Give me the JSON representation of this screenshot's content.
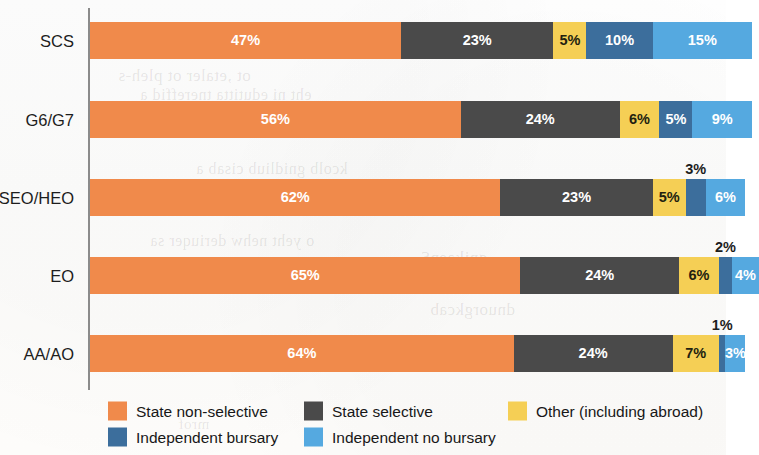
{
  "chart_data": {
    "type": "bar",
    "subtype": "horizontal-100-percent-stacked",
    "title": "",
    "xlabel": "",
    "ylabel": "",
    "xlim": [
      0,
      100
    ],
    "grid": false,
    "legend_position": "bottom-left",
    "categories": [
      "SCS",
      "G6/G7",
      "SEO/HEO",
      "EO",
      "AA/AO"
    ],
    "series": [
      {
        "name": "State non-selective",
        "color": "#F08A4B",
        "values": [
          47,
          56,
          62,
          65,
          64
        ],
        "labels": [
          "47%",
          "56%",
          "62%",
          "65%",
          "64%"
        ]
      },
      {
        "name": "State selective",
        "color": "#4A4A4A",
        "values": [
          23,
          24,
          23,
          24,
          24
        ],
        "labels": [
          "23%",
          "24%",
          "23%",
          "24%",
          "24%"
        ]
      },
      {
        "name": "Other (including abroad)",
        "color": "#F5CF55",
        "values": [
          5,
          6,
          5,
          6,
          7
        ],
        "labels": [
          "5%",
          "6%",
          "5%",
          "6%",
          "7%"
        ]
      },
      {
        "name": "Independent bursary",
        "color": "#3C6E9C",
        "values": [
          10,
          5,
          3,
          2,
          1
        ],
        "labels": [
          "10%",
          "5%",
          "3%",
          "2%",
          "1%"
        ]
      },
      {
        "name": "Independent no bursary",
        "color": "#55A9E0",
        "values": [
          15,
          9,
          6,
          4,
          3
        ],
        "labels": [
          "15%",
          "9%",
          "6%",
          "4%",
          "3%"
        ]
      }
    ]
  },
  "axis": {
    "categories": [
      "SCS",
      "G6/G7",
      "SEO/HEO",
      "EO",
      "AA/AO"
    ]
  },
  "bars": [
    {
      "category": "SCS",
      "segments": [
        {
          "series": "State non-selective",
          "value": 47,
          "label": "47%",
          "color": "#F08A4B",
          "text": "light",
          "placement": "inside"
        },
        {
          "series": "State selective",
          "value": 23,
          "label": "23%",
          "color": "#4A4A4A",
          "text": "light",
          "placement": "inside"
        },
        {
          "series": "Other (including abroad)",
          "value": 5,
          "label": "5%",
          "color": "#F5CF55",
          "text": "dark",
          "placement": "inside"
        },
        {
          "series": "Independent bursary",
          "value": 10,
          "label": "10%",
          "color": "#3C6E9C",
          "text": "light",
          "placement": "inside"
        },
        {
          "series": "Independent no bursary",
          "value": 15,
          "label": "15%",
          "color": "#55A9E0",
          "text": "light",
          "placement": "inside"
        }
      ]
    },
    {
      "category": "G6/G7",
      "segments": [
        {
          "series": "State non-selective",
          "value": 56,
          "label": "56%",
          "color": "#F08A4B",
          "text": "light",
          "placement": "inside"
        },
        {
          "series": "State selective",
          "value": 24,
          "label": "24%",
          "color": "#4A4A4A",
          "text": "light",
          "placement": "inside"
        },
        {
          "series": "Other (including abroad)",
          "value": 6,
          "label": "6%",
          "color": "#F5CF55",
          "text": "dark",
          "placement": "inside"
        },
        {
          "series": "Independent bursary",
          "value": 5,
          "label": "5%",
          "color": "#3C6E9C",
          "text": "light",
          "placement": "inside"
        },
        {
          "series": "Independent no bursary",
          "value": 9,
          "label": "9%",
          "color": "#55A9E0",
          "text": "light",
          "placement": "inside"
        }
      ]
    },
    {
      "category": "SEO/HEO",
      "segments": [
        {
          "series": "State non-selective",
          "value": 62,
          "label": "62%",
          "color": "#F08A4B",
          "text": "light",
          "placement": "inside"
        },
        {
          "series": "State selective",
          "value": 23,
          "label": "23%",
          "color": "#4A4A4A",
          "text": "light",
          "placement": "inside"
        },
        {
          "series": "Other (including abroad)",
          "value": 5,
          "label": "5%",
          "color": "#F5CF55",
          "text": "dark",
          "placement": "inside"
        },
        {
          "series": "Independent bursary",
          "value": 3,
          "label": "3%",
          "color": "#3C6E9C",
          "text": "dark",
          "placement": "outside"
        },
        {
          "series": "Independent no bursary",
          "value": 6,
          "label": "6%",
          "color": "#55A9E0",
          "text": "light",
          "placement": "inside"
        }
      ]
    },
    {
      "category": "EO",
      "segments": [
        {
          "series": "State non-selective",
          "value": 65,
          "label": "65%",
          "color": "#F08A4B",
          "text": "light",
          "placement": "inside"
        },
        {
          "series": "State selective",
          "value": 24,
          "label": "24%",
          "color": "#4A4A4A",
          "text": "light",
          "placement": "inside"
        },
        {
          "series": "Other (including abroad)",
          "value": 6,
          "label": "6%",
          "color": "#F5CF55",
          "text": "dark",
          "placement": "inside"
        },
        {
          "series": "Independent bursary",
          "value": 2,
          "label": "2%",
          "color": "#3C6E9C",
          "text": "dark",
          "placement": "outside"
        },
        {
          "series": "Independent no bursary",
          "value": 4,
          "label": "4%",
          "color": "#55A9E0",
          "text": "light",
          "placement": "inside"
        }
      ]
    },
    {
      "category": "AA/AO",
      "segments": [
        {
          "series": "State non-selective",
          "value": 64,
          "label": "64%",
          "color": "#F08A4B",
          "text": "light",
          "placement": "inside"
        },
        {
          "series": "State selective",
          "value": 24,
          "label": "24%",
          "color": "#4A4A4A",
          "text": "light",
          "placement": "inside"
        },
        {
          "series": "Other (including abroad)",
          "value": 7,
          "label": "7%",
          "color": "#F5CF55",
          "text": "dark",
          "placement": "inside"
        },
        {
          "series": "Independent bursary",
          "value": 1,
          "label": "1%",
          "color": "#3C6E9C",
          "text": "dark",
          "placement": "outside"
        },
        {
          "series": "Independent no bursary",
          "value": 3,
          "label": "3%",
          "color": "#55A9E0",
          "text": "light",
          "placement": "inside"
        }
      ]
    }
  ],
  "legend": {
    "rows": [
      [
        {
          "label": "State non-selective",
          "color": "#F08A4B"
        },
        {
          "label": "State selective",
          "color": "#4A4A4A"
        },
        {
          "label": "Other (including abroad)",
          "color": "#F5CF55"
        }
      ],
      [
        {
          "label": "Independent bursary",
          "color": "#3C6E9C"
        },
        {
          "label": "Independent no bursary",
          "color": "#55A9E0"
        }
      ]
    ]
  },
  "colors": {
    "state_non_selective": "#F08A4B",
    "state_selective": "#4A4A4A",
    "other_including_abroad": "#F5CF55",
    "independent_bursary": "#3C6E9C",
    "independent_no_bursary": "#55A9E0",
    "axis_line": "#8B8B8B",
    "page_background": "#FFFFFF"
  }
}
